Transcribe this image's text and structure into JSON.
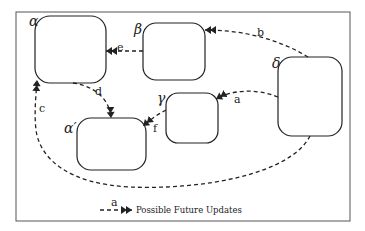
{
  "diagram": {
    "nodes": [
      {
        "id": "alpha",
        "label": "α",
        "x": 35,
        "y": 16,
        "w": 71,
        "h": 67,
        "lx": 30,
        "ly": 25
      },
      {
        "id": "beta",
        "label": "β",
        "x": 143,
        "y": 23,
        "w": 62,
        "h": 57,
        "lx": 135,
        "ly": 33
      },
      {
        "id": "delta",
        "label": "δ",
        "x": 278,
        "y": 57,
        "w": 64,
        "h": 79,
        "lx": 273,
        "ly": 67
      },
      {
        "id": "gamma",
        "label": "γ",
        "x": 166,
        "y": 93,
        "w": 52,
        "h": 50,
        "lx": 158,
        "ly": 102
      },
      {
        "id": "alpha_prime",
        "label": "α′",
        "x": 77,
        "y": 118,
        "w": 69,
        "h": 52,
        "lx": 64,
        "ly": 132
      }
    ],
    "edges": [
      {
        "id": "a",
        "label": "a",
        "from": "delta",
        "to": "gamma"
      },
      {
        "id": "b",
        "label": "b",
        "from": "delta",
        "to": "beta"
      },
      {
        "id": "c",
        "label": "c",
        "from": "delta",
        "to": "alpha"
      },
      {
        "id": "d",
        "label": "d",
        "from": "alpha",
        "to": "alpha_prime"
      },
      {
        "id": "e",
        "label": "e",
        "from": "beta",
        "to": "alpha"
      },
      {
        "id": "f",
        "label": "f",
        "from": "gamma",
        "to": "alpha_prime"
      }
    ],
    "legend": {
      "edge_label": "a",
      "text": "Possible Future Updates"
    }
  },
  "colors": {
    "stroke": "#222222",
    "frame": "#555555",
    "background": "#ffffff"
  }
}
